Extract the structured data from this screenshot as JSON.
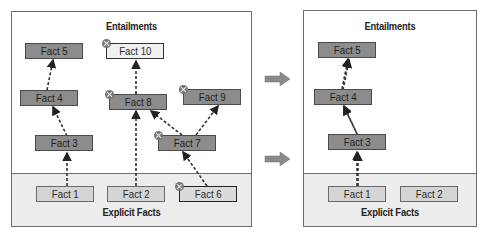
{
  "before": {
    "entailments_title": "Entailments",
    "explicit_title": "Explicit Facts",
    "facts": {
      "fact5": "Fact 5",
      "fact10": "Fact 10",
      "fact4": "Fact 4",
      "fact8": "Fact 8",
      "fact9": "Fact 9",
      "fact3": "Fact 3",
      "fact7": "Fact 7",
      "fact1": "Fact 1",
      "fact2": "Fact 2",
      "fact6": "Fact 6"
    },
    "retracted": [
      "Fact 10",
      "Fact 8",
      "Fact 9",
      "Fact 7",
      "Fact 6"
    ],
    "edges": [
      [
        "Fact 1",
        "Fact 3"
      ],
      [
        "Fact 3",
        "Fact 4"
      ],
      [
        "Fact 4",
        "Fact 5"
      ],
      [
        "Fact 2",
        "Fact 8"
      ],
      [
        "Fact 8",
        "Fact 10"
      ],
      [
        "Fact 7",
        "Fact 8"
      ],
      [
        "Fact 7",
        "Fact 9"
      ],
      [
        "Fact 6",
        "Fact 7"
      ]
    ]
  },
  "after": {
    "entailments_title": "Entailments",
    "explicit_title": "Explicit Facts",
    "facts": {
      "fact5": "Fact 5",
      "fact4": "Fact 4",
      "fact3": "Fact 3",
      "fact1": "Fact 1",
      "fact2": "Fact 2"
    },
    "edges": [
      [
        "Fact 1",
        "Fact 3"
      ],
      [
        "Fact 3",
        "Fact 4"
      ],
      [
        "Fact 4",
        "Fact 5"
      ]
    ]
  },
  "arrows": {
    "count": 2,
    "color": "#8a8a8a",
    "icon": "right-arrow-icon"
  },
  "colors": {
    "entailed_fill": "#8c8c8c",
    "explicit_fill": "#d4d4d4",
    "explicit_area": "#ececec",
    "border": "#6e6e6e",
    "retract_marker": "#777777"
  }
}
